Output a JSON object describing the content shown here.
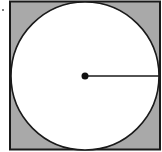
{
  "diagram": {
    "type": "circle-inscribed-in-square",
    "square": {
      "x": 9,
      "y": 1,
      "size": 151,
      "fill": "#a9a9a9",
      "stroke": "#1a1a1a"
    },
    "circle": {
      "cx": 85,
      "cy": 77,
      "r": 75,
      "fill": "#ffffff",
      "stroke": "#1a1a1a"
    },
    "radius_line": {
      "from": "center",
      "to": "right-edge",
      "stroke": "#1a1a1a"
    },
    "center_dot": {
      "r": 3.5,
      "fill": "#111111"
    },
    "stray_mark": {
      "x": 3,
      "y": 10
    },
    "shaded_region": "square minus circle"
  }
}
